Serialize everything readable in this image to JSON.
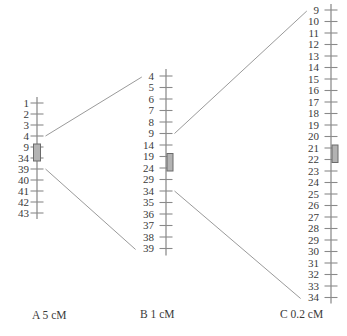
{
  "figure": {
    "background": "#ffffff",
    "line_color": "#8f8f8f",
    "tick_color": "#8a8a8a",
    "connector_color": "#9a9a9a",
    "text_color": "#3a3a3a",
    "marker_fill": "#b3b3b3",
    "marker_stroke": "#6b6b6b"
  },
  "chart_data": {
    "type": "linkage-map-diagram",
    "title": "",
    "maps": [
      {
        "id": "A",
        "caption": "A 5 cM",
        "scale_per_tick": "5 cM",
        "loci": [
          "1",
          "2",
          "3",
          "4",
          "9",
          "34",
          "39",
          "40",
          "41",
          "42",
          "43"
        ],
        "highlight_region": {
          "from": "9",
          "to": "34",
          "side": "center"
        }
      },
      {
        "id": "B",
        "caption": "B 1 cM",
        "scale_per_tick": "1 cM",
        "loci": [
          "4",
          "5",
          "6",
          "7",
          "8",
          "9",
          "14",
          "19",
          "24",
          "29",
          "34",
          "35",
          "36",
          "37",
          "38",
          "39"
        ],
        "highlight_region": {
          "from": "19",
          "to": "24",
          "side": "right"
        }
      },
      {
        "id": "C",
        "caption": "C 0.2 cM",
        "scale_per_tick": "0.2 cM",
        "loci": [
          "9",
          "10",
          "11",
          "12",
          "13",
          "14",
          "15",
          "16",
          "17",
          "18",
          "19",
          "20",
          "21",
          "22",
          "23",
          "24",
          "25",
          "26",
          "27",
          "28",
          "29",
          "30",
          "31",
          "32",
          "33",
          "34"
        ],
        "highlight_region": {
          "from": "21",
          "to": "22",
          "side": "right"
        }
      }
    ],
    "connectors": [
      {
        "from_map": "A",
        "from_locus": "4",
        "to_map": "B",
        "to_locus": "4"
      },
      {
        "from_map": "A",
        "from_locus": "39",
        "to_map": "B",
        "to_locus": "39"
      },
      {
        "from_map": "B",
        "from_locus": "9",
        "to_map": "C",
        "to_locus": "9"
      },
      {
        "from_map": "B",
        "from_locus": "34",
        "to_map": "C",
        "to_locus": "34"
      }
    ]
  }
}
